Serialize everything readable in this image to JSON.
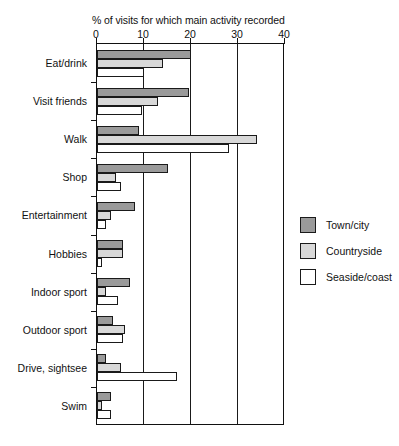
{
  "chart_data": {
    "type": "bar",
    "orientation": "horizontal",
    "title": "% of visits for which main activity recorded",
    "xlabel": "",
    "ylabel": "",
    "xlim": [
      0,
      40
    ],
    "xticks": [
      0,
      10,
      20,
      30,
      40
    ],
    "xtick_labels": [
      "0",
      "10",
      "20",
      "30",
      "40"
    ],
    "grid": "vertical",
    "legend_position": "right",
    "categories": [
      "Eat/drink",
      "Visit friends",
      "Walk",
      "Shop",
      "Entertainment",
      "Hobbies",
      "Indoor sport",
      "Outdoor sport",
      "Drive, sightsee",
      "Swim"
    ],
    "series": [
      {
        "name": "Town/city",
        "color": "#9a9a9a",
        "values": [
          20,
          19.5,
          9,
          15,
          8,
          5.5,
          7,
          3.5,
          2,
          3
        ]
      },
      {
        "name": "Countryside",
        "color": "#d8d8d8",
        "values": [
          14,
          13,
          34,
          4,
          3,
          5.5,
          2,
          6,
          5,
          1
        ]
      },
      {
        "name": "Seaside/coast",
        "color": "#ffffff",
        "values": [
          10,
          9.5,
          28,
          5,
          2,
          1,
          4.5,
          5.5,
          17,
          3
        ]
      }
    ]
  },
  "legend": {
    "items": [
      {
        "label": "Town/city",
        "swatch": "town"
      },
      {
        "label": "Countryside",
        "swatch": "country"
      },
      {
        "label": "Seaside/coast",
        "swatch": "seaside"
      }
    ]
  }
}
